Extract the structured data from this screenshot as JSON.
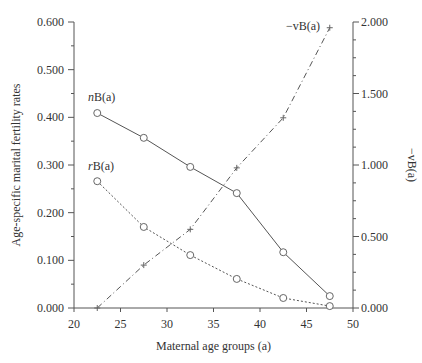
{
  "chart_data": {
    "type": "line",
    "title": "",
    "xlabel": "Maternal age groups  (a)",
    "ylabel": "Age-specific marital fertility rates",
    "y2label": "−vB(a)",
    "xlim": [
      20,
      50
    ],
    "ylim": [
      0,
      0.6
    ],
    "y2lim": [
      0,
      2.0
    ],
    "x_ticks": [
      "20",
      "25",
      "30",
      "35",
      "40",
      "45",
      "50"
    ],
    "y_ticks": [
      "0.000",
      "0.100",
      "0.200",
      "0.300",
      "0.400",
      "0.500",
      "0.600"
    ],
    "y2_ticks": [
      "0.000",
      "0.500",
      "1.000",
      "1.500",
      "2.000"
    ],
    "grid": false,
    "x": [
      22.5,
      27.5,
      32.5,
      37.5,
      42.5,
      47.5
    ],
    "series": [
      {
        "name": "nB(a)",
        "axis": "left",
        "style": "solid",
        "marker": "circle",
        "values": [
          0.409,
          0.357,
          0.296,
          0.241,
          0.117,
          0.025
        ]
      },
      {
        "name": "rB(a)",
        "axis": "left",
        "style": "dotted",
        "marker": "circle",
        "values": [
          0.266,
          0.17,
          0.111,
          0.061,
          0.021,
          0.004
        ]
      },
      {
        "name": "−vB(a)",
        "axis": "right",
        "style": "dashdot",
        "marker": "plus",
        "values": [
          0.0,
          0.3,
          0.55,
          0.98,
          1.33,
          1.96
        ]
      }
    ],
    "annotations": [
      {
        "text": "nB(a)",
        "italic_prefix": "n",
        "rest": "B(a)",
        "x": 22.5,
        "y": 0.435
      },
      {
        "text": "rB(a)",
        "italic_prefix": "r",
        "rest": "B(a)",
        "x": 22.5,
        "y": 0.29
      },
      {
        "text": "−vB(a)",
        "x": 42.5,
        "y2": 1.95
      }
    ]
  }
}
